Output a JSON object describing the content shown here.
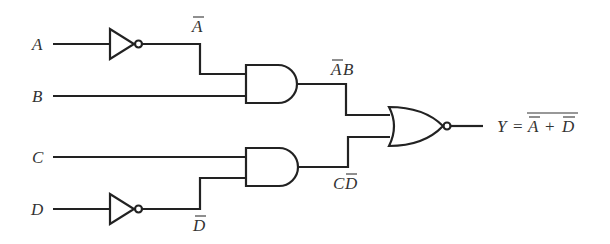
{
  "diagram": {
    "type": "logic-circuit",
    "inputs": [
      {
        "id": "A",
        "label": "A"
      },
      {
        "id": "B",
        "label": "B"
      },
      {
        "id": "C",
        "label": "C"
      },
      {
        "id": "D",
        "label": "D"
      }
    ],
    "gates": [
      {
        "id": "inv1",
        "type": "NOT",
        "input": "A",
        "output_label": "A",
        "output_overbar": true
      },
      {
        "id": "and1",
        "type": "AND",
        "inputs": [
          "inv1",
          "B"
        ],
        "output_label_parts": [
          "A",
          "B"
        ],
        "overbar_on": [
          "A"
        ]
      },
      {
        "id": "inv2",
        "type": "NOT",
        "input": "D",
        "output_label": "D",
        "output_overbar": true
      },
      {
        "id": "and2",
        "type": "AND",
        "inputs": [
          "C",
          "inv2"
        ],
        "output_label_parts": [
          "C",
          "D"
        ],
        "overbar_on": [
          "D"
        ]
      },
      {
        "id": "nor1",
        "type": "NOR",
        "inputs": [
          "and1",
          "and2"
        ]
      }
    ],
    "output": {
      "label": "Y",
      "equals": "=",
      "expression_parts": [
        "A",
        "+",
        "D"
      ],
      "expression_text": "Y = NOT( NOT(A) + NOT(D) )"
    },
    "labels": {
      "a": "A",
      "b": "B",
      "c": "C",
      "d": "D",
      "a_bar": "A",
      "ab_a": "A",
      "ab_b": "B",
      "cd_c": "C",
      "cd_d": "D",
      "d_bar": "D",
      "y": "Y",
      "eq": "=",
      "y_a": "A",
      "plus": "+",
      "y_d": "D"
    }
  }
}
